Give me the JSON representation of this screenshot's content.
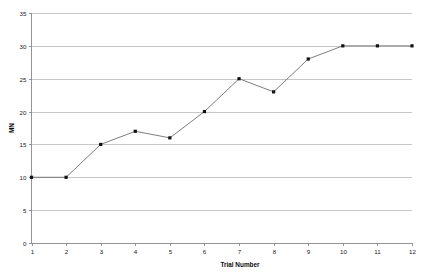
{
  "chart_data": {
    "type": "line",
    "title": "",
    "subtitle": "",
    "xlabel": "Trial Number",
    "ylabel": "MN",
    "x": [
      1,
      2,
      3,
      4,
      5,
      6,
      7,
      8,
      9,
      10,
      11,
      12
    ],
    "categories": [
      "1",
      "2",
      "3",
      "4",
      "5",
      "6",
      "7",
      "8",
      "9",
      "10",
      "11",
      "12"
    ],
    "values": [
      10,
      10,
      15,
      17,
      16,
      20,
      25,
      23,
      28,
      30,
      30,
      30
    ],
    "series": [
      {
        "name": "MN",
        "values": [
          10,
          10,
          15,
          17,
          16,
          20,
          25,
          23,
          28,
          30,
          30,
          30
        ]
      }
    ],
    "xlim": [
      1,
      12
    ],
    "ylim": [
      0,
      35
    ],
    "ytick_labels": [
      "0",
      "5",
      "10",
      "15",
      "20",
      "25",
      "30",
      "35"
    ],
    "ytick_values": [
      0,
      5,
      10,
      15,
      20,
      25,
      30,
      35
    ],
    "xtick_labels": [
      "1",
      "2",
      "3",
      "4",
      "5",
      "6",
      "7",
      "8",
      "9",
      "10",
      "11",
      "12"
    ],
    "grid": "horizontal",
    "legend": "none",
    "marker": "square",
    "colors": {
      "line": "#6e6e6e",
      "marker": "#111111",
      "grid": "#b9b9b9",
      "axis": "#8a8a8a",
      "background": "#ffffff",
      "text": "#1a1a1a"
    }
  }
}
